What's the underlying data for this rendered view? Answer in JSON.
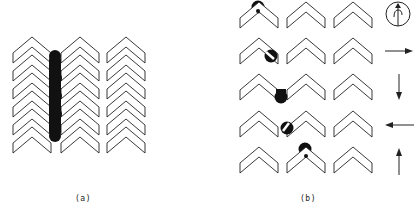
{
  "panels": [
    {
      "id": "a",
      "label": "(a)",
      "description": "Three columns of six stacked chevrons with a vertical black bar between column 1 and 2",
      "columns": 3,
      "rows": 6
    },
    {
      "id": "b",
      "label": "(b)",
      "description": "Five rows of three chevrons each; a black blob moves position row by row, with direction indicators at right",
      "rows": 5,
      "columns": 3,
      "indicators": [
        "rotation-circle",
        "arrow-right",
        "arrow-down",
        "arrow-left",
        "arrow-up"
      ]
    }
  ],
  "colors": {
    "stroke": "#222222",
    "fill": "#111111",
    "background": "#ffffff"
  }
}
